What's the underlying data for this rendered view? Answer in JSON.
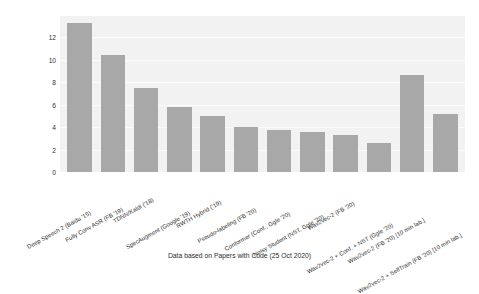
{
  "chart_data": {
    "type": "bar",
    "title": "",
    "subtitle": "",
    "xlabel": "",
    "ylabel": "Word Error Rate (test-other)",
    "ylim": [
      0,
      13.9
    ],
    "yticks": [
      0,
      2,
      4,
      6,
      8,
      10,
      12
    ],
    "grid": true,
    "legend": null,
    "bar_color": "#a8a8a8",
    "plot_background": "#f2f2f2",
    "categories": [
      "Deep Speech 2 (Baidu '15)",
      "Fully Conv ASR (FB '19)",
      "TDNN/Kaldi ('18)",
      "SpecAugment (Google '19)",
      "RWTH Hybrid ('19)",
      "Pseudo-labeling (FB '20)",
      "Conformer (Conf., Ggle '20)",
      "Noisy Student (NST, Ggle '20)",
      "Wav2vec-2 (FB '20)",
      "Wav2vec-2 + Conf. + NST (Ggle '20)",
      "Wav2vec-2 (FB '20) [10 min lab.]",
      "Wav2vec-2 + SelfTrain (FB '20) [10 min lab.]"
    ],
    "values": [
      13.25,
      10.45,
      7.5,
      5.8,
      5.0,
      4.0,
      3.7,
      3.6,
      3.3,
      2.6,
      8.6,
      5.2
    ],
    "caption": "Data based on Papers with Code (25 Oct 2020)"
  }
}
